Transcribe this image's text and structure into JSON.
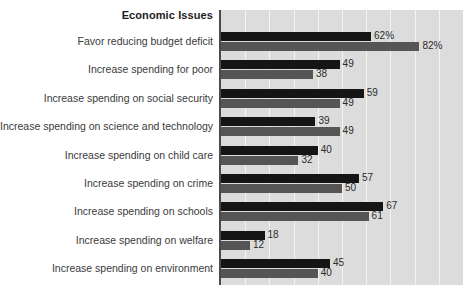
{
  "chart_data": {
    "type": "bar",
    "orientation": "horizontal",
    "title": "Economic Issues",
    "xlabel": "",
    "ylabel": "",
    "xlim": [
      0,
      100
    ],
    "grid": true,
    "gridline_interval": 10,
    "legend": "none",
    "value_suffix_first_row": "%",
    "categories": [
      "Favor reducing budget deficit",
      "Increase spending for poor",
      "Increase spending on social security",
      "Increase spending on science and technology",
      "Increase spending on child care",
      "Increase spending on crime",
      "Increase spending on schools",
      "Increase spending on welfare",
      "Increase spending on environment"
    ],
    "series": [
      {
        "name": "series-dark",
        "color": "#151515",
        "values": [
          62,
          49,
          59,
          39,
          40,
          57,
          67,
          18,
          45
        ],
        "labels": [
          "62%",
          "49",
          "59",
          "39",
          "40",
          "57",
          "67",
          "18",
          "45"
        ]
      },
      {
        "name": "series-gray",
        "color": "#555555",
        "values": [
          82,
          38,
          49,
          49,
          32,
          50,
          61,
          12,
          40
        ],
        "labels": [
          "82%",
          "38",
          "49",
          "49",
          "32",
          "50",
          "61",
          "12",
          "40"
        ]
      }
    ]
  },
  "colors": {
    "plot_background": "#dcdcdc",
    "gridline": "#f4f4f4",
    "axis": "#4a4a4a",
    "series_dark": "#151515",
    "series_gray": "#555555",
    "label_text": "#3a3a3a",
    "title_text": "#1d1d1d"
  }
}
